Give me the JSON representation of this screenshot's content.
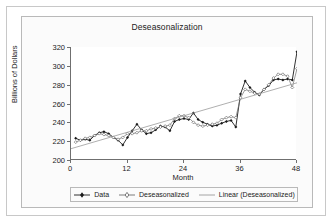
{
  "chart_data": {
    "type": "line",
    "title": "Deseasonalization",
    "xlabel": "Month",
    "ylabel": "Billions of Dollars",
    "xlim": [
      0,
      48
    ],
    "ylim": [
      200,
      320
    ],
    "xticks": [
      0,
      12,
      24,
      36,
      48
    ],
    "yticks": [
      200,
      220,
      240,
      260,
      280,
      300,
      320
    ],
    "grid": false,
    "legend_position": "bottom",
    "x": [
      1,
      2,
      3,
      4,
      5,
      6,
      7,
      8,
      9,
      10,
      11,
      12,
      13,
      14,
      15,
      16,
      17,
      18,
      19,
      20,
      21,
      22,
      23,
      24,
      25,
      26,
      27,
      28,
      29,
      30,
      31,
      32,
      33,
      34,
      35,
      36,
      37,
      38,
      39,
      40,
      41,
      42,
      43,
      44,
      45,
      46,
      47,
      48
    ],
    "series": [
      {
        "name": "Data",
        "marker": "filled-diamond",
        "color": "#1a1a1a",
        "values": [
          223,
          221,
          222,
          221,
          226,
          229,
          230,
          228,
          224,
          221,
          216,
          224,
          231,
          238,
          232,
          228,
          229,
          232,
          236,
          235,
          231,
          241,
          243,
          244,
          243,
          250,
          243,
          240,
          238,
          236,
          237,
          239,
          241,
          242,
          235,
          270,
          284,
          277,
          272,
          269,
          275,
          279,
          285,
          286,
          285,
          286,
          285,
          315
        ]
      },
      {
        "name": "Deseasonalized",
        "marker": "open-diamond",
        "color": "#6e6e6e",
        "values": [
          219,
          221,
          223,
          224,
          226,
          228,
          227,
          226,
          224,
          222,
          224,
          228,
          228,
          229,
          231,
          231,
          233,
          234,
          235,
          236,
          237,
          244,
          247,
          247,
          245,
          240,
          237,
          236,
          237,
          238,
          239,
          243,
          245,
          246,
          245,
          266,
          275,
          273,
          271,
          270,
          275,
          280,
          287,
          291,
          291,
          289,
          277,
          297
        ]
      },
      {
        "name": "Linear (Deseasonalized)",
        "marker": "none",
        "color": "#9a9a9a",
        "type": "trendline",
        "endpoints": [
          [
            0,
            212
          ],
          [
            48,
            282
          ]
        ]
      }
    ]
  },
  "legend": {
    "items": [
      {
        "label": "Data"
      },
      {
        "label": "Deseasonalized"
      },
      {
        "label": "Linear (Deseasonalized)"
      }
    ]
  },
  "axis": {
    "y_labels": [
      "320",
      "300",
      "280",
      "260",
      "240",
      "220",
      "200"
    ],
    "x_labels": [
      "0",
      "12",
      "24",
      "36",
      "48"
    ]
  }
}
